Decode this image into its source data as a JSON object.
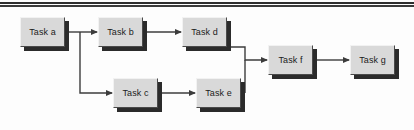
{
  "diagram": {
    "background_color": "#fdfdfd",
    "node_fill_color": "#d9d9d9",
    "node_border_color": "#4a4a4a",
    "node_shadow_color": "#2b2b2b",
    "connector_color": "#3c3c3c",
    "text_color": "#1b1b1b",
    "top_rule_color": "#2e2e2e",
    "nodes": [
      {
        "id": "a",
        "label": "Task a",
        "x": 20,
        "y": 17,
        "w": 45,
        "h": 30
      },
      {
        "id": "b",
        "label": "Task b",
        "x": 98,
        "y": 17,
        "w": 45,
        "h": 30
      },
      {
        "id": "d",
        "label": "Task d",
        "x": 182,
        "y": 17,
        "w": 45,
        "h": 30
      },
      {
        "id": "c",
        "label": "Task c",
        "x": 113,
        "y": 78,
        "w": 45,
        "h": 30
      },
      {
        "id": "e",
        "label": "Task e",
        "x": 196,
        "y": 78,
        "w": 45,
        "h": 30
      },
      {
        "id": "f",
        "label": "Task f",
        "x": 268,
        "y": 45,
        "w": 45,
        "h": 30
      },
      {
        "id": "g",
        "label": "Task g",
        "x": 350,
        "y": 45,
        "w": 45,
        "h": 30
      }
    ],
    "edges": [
      {
        "id": "a-b",
        "from": "a",
        "to": "b"
      },
      {
        "id": "a-c",
        "from": "a",
        "to": "c"
      },
      {
        "id": "b-d",
        "from": "b",
        "to": "d"
      },
      {
        "id": "c-e",
        "from": "c",
        "to": "e"
      },
      {
        "id": "d-f",
        "from": "d",
        "to": "f"
      },
      {
        "id": "e-f",
        "from": "e",
        "to": "f"
      },
      {
        "id": "f-g",
        "from": "f",
        "to": "g"
      }
    ]
  }
}
